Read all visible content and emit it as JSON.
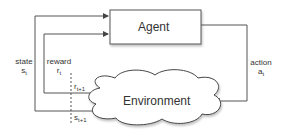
{
  "diagram": {
    "nodes": {
      "agent": "Agent",
      "environment": "Environment"
    },
    "edges": {
      "state": {
        "label": "state",
        "symbol": "s",
        "subscript": "t"
      },
      "reward": {
        "label": "reward",
        "symbol": "r",
        "subscript": "t"
      },
      "action": {
        "label": "action",
        "symbol": "a",
        "subscript": "t"
      },
      "next_reward": {
        "symbol": "r",
        "subscript": "t+1"
      },
      "next_state": {
        "symbol": "s",
        "subscript": "t+1"
      }
    },
    "colors": {
      "line": "#555555",
      "box_border": "#555555",
      "text": "#333333"
    }
  }
}
